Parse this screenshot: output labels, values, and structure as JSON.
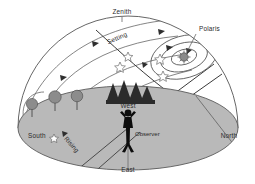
{
  "diagram": {
    "background_color": "#ffffff",
    "ground_color": "#b9b9b9",
    "line_color": "#555555",
    "labels": {
      "zenith": "Zenith",
      "polaris": "Polaris",
      "setting": "Setting",
      "rising": "Rising",
      "north": "North",
      "south": "South",
      "east": "East",
      "west": "West",
      "observer": "Observer"
    },
    "elements": {
      "dome": "celestial-dome",
      "ground": "horizon-plane",
      "observer_figure": "observer-silhouette",
      "polaris_star": "polaris-star-symbol",
      "conifer_trees": "pine-tree-cluster",
      "round_trees": "deciduous-tree-row",
      "star_trails": "star-trail-arcs",
      "circumpolar_circles": "circumpolar-star-circles"
    },
    "counts": {
      "round_trees": 3,
      "conifer_trees": 4,
      "circumpolar_circles": 3,
      "star_trail_arcs": 4,
      "open_stars": 5
    }
  }
}
